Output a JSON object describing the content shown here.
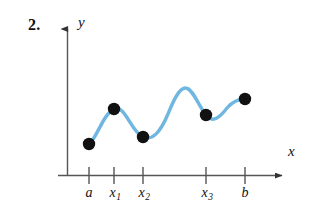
{
  "figure": {
    "problem_number": "2.",
    "x_axis_label": "x",
    "y_axis_label": "y",
    "curve_color": "#6FB7E0",
    "point_color": "#111111",
    "axis_color": "#555555"
  },
  "ticks": [
    {
      "name": "a",
      "base": "a",
      "sub": "",
      "x": 89
    },
    {
      "name": "x1",
      "base": "x",
      "sub": "1",
      "x": 114
    },
    {
      "name": "x2",
      "base": "x",
      "sub": "2",
      "x": 143
    },
    {
      "name": "x3",
      "base": "x",
      "sub": "3",
      "x": 206
    },
    {
      "name": "b",
      "base": "b",
      "sub": "",
      "x": 245
    }
  ],
  "chart_data": {
    "type": "line",
    "title": "",
    "xlabel": "x",
    "ylabel": "y",
    "grid": false,
    "legend": "none",
    "xlim": [
      67,
      300
    ],
    "ylim": [
      175,
      20
    ],
    "tick_labels": [
      "a",
      "x₁",
      "x₂",
      "x₃",
      "b"
    ],
    "tick_x": [
      89,
      114,
      143,
      206,
      245
    ],
    "marked_points": [
      {
        "label": "a",
        "x": 89,
        "y": 144
      },
      {
        "label": "x1",
        "x": 114,
        "y": 109
      },
      {
        "label": "x2",
        "x": 143,
        "y": 137
      },
      {
        "label": "x3",
        "x": 206,
        "y": 115
      },
      {
        "label": "b",
        "x": 245,
        "y": 99
      }
    ],
    "curve_path": "M 89,144 C 97,138 103,114 114,109 C 125,104 131,132 143,137 C 152,141 160,133 168,114 C 174,99 180,87 186,88 C 193,89 198,105 206,115 C 213,124 220,117 227,108 C 234,100 240,99 245,99",
    "annotations": [
      "Curve begins at point (a) and oscillates with local maxima and minima; dots mark the partition endpoints."
    ]
  }
}
